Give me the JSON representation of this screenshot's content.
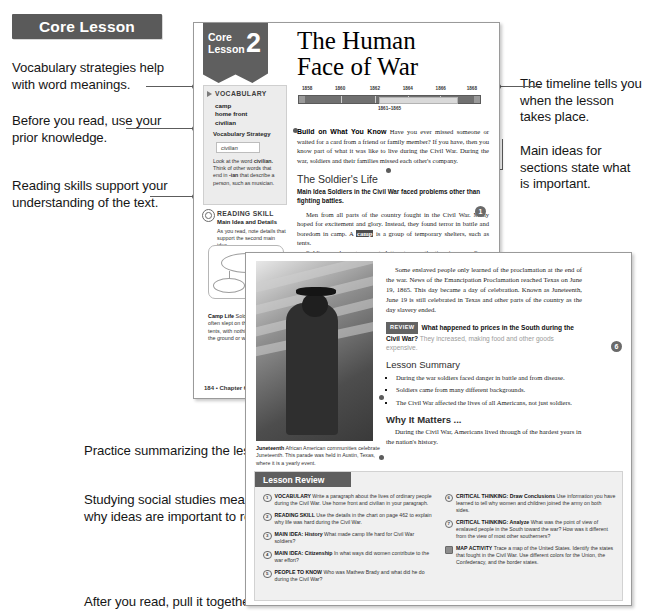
{
  "banner": {
    "label": "Core Lesson"
  },
  "annotations": {
    "left": [
      {
        "id": "vocab",
        "text": "Vocabulary strategies help with word meanings."
      },
      {
        "id": "prior",
        "text": "Before you read, use your prior knowledge."
      },
      {
        "id": "reading",
        "text": "Reading skills support your understanding of the text."
      },
      {
        "id": "practice",
        "text": "Practice summarizing the lesson."
      },
      {
        "id": "why",
        "text": "Studying social studies means asking why ideas are important to remember."
      },
      {
        "id": "pull",
        "text": "After you read, pull it together!"
      }
    ],
    "right": [
      {
        "id": "timeline",
        "text": "The timeline tells you when the lesson takes place."
      },
      {
        "id": "mainideas",
        "text": "Main ideas for sections state what is important."
      }
    ]
  },
  "page_one": {
    "flag": {
      "core": "Core",
      "lesson": "Lesson",
      "number": "2"
    },
    "title_line1": "The Human",
    "title_line2": "Face of War",
    "timeline": {
      "years": [
        "1858",
        "1860",
        "1862",
        "1864",
        "1866",
        "1868"
      ],
      "span_label": "1861–1865"
    },
    "vocabulary": {
      "heading": "VOCABULARY",
      "terms": [
        "camp",
        "home front",
        "civilian"
      ],
      "strategy_heading": "Vocabulary Strategy",
      "strategy_word": "civilian",
      "strategy_note_a": "Look at the word ",
      "strategy_note_b": "civilian.",
      "strategy_note_c": " Think of other words that end in ",
      "strategy_note_d": "-ian",
      "strategy_note_e": " that describe a person, such as musician."
    },
    "reading_skill": {
      "heading": "READING SKILL",
      "subheading": "Main Idea and Details",
      "body": "As you read, note details that support the second main idea."
    },
    "camp_life": {
      "title": "Camp Life",
      "body": " Soldiers in camp often slept on the ground in tents, with nothing to sit on but the ground or wooden boxes."
    },
    "build": {
      "label": "Build on What You Know",
      "body": " Have you ever missed someone or waited for a card from a friend or family member? If you have, then you know part of what it was like to live during the Civil War. During the war, soldiers and their families missed each other's company."
    },
    "section_heading": "The Soldier's Life",
    "main_idea": "Main Idea  Soldiers in the Civil War faced problems other than fighting battles.",
    "paragraph_1a": "Men from all parts of the country fought in the Civil War. Many hoped for excitement and glory. Instead, they found terror in battle and boredom in camp. A ",
    "paragraph_1_kw": "camp",
    "paragraph_1b": " is a group of temporary shelters, such as tents.",
    "paragraph_2": "Soldiers read, sang, or wrote letters to pass the time in camp. Some put on plays or held religious services. They loved to get letters from home. Letters brought joy to hearts from home.",
    "paragraph_3": "Food in the army was often bad. Union soldiers grew tired of eating hardtack, a hard, dry cracker. However, Confederate soldiers had less to eat because they did not have enough food.",
    "marker_number": "1",
    "folio": "184 • Chapter 6"
  },
  "page_two": {
    "paragraph_1": "Some enslaved people only learned of the proclamation at the end of the war. News of the Emancipation Proclamation reached Texas on June 19, 1865. This day became a day of celebration. Known as Juneteenth, June 19 is still celebrated in Texas and other parts of the country as the day slavery ended.",
    "review": {
      "tag": "REVIEW",
      "question": "What happened to prices in the South during the Civil War?",
      "answer": " They increased, making food and other goods expensive."
    },
    "summary_heading": "Lesson Summary",
    "summary_items": [
      "During the war soldiers faced danger in battle and from disease.",
      "Soldiers came from many different backgrounds.",
      "The Civil War affected the lives of all Americans, not just soldiers."
    ],
    "why_heading": "Why It Matters ...",
    "why_body": "During the Civil War, Americans lived through of the hardest years in the nation's history.",
    "folio": "6",
    "juneteenth": {
      "title": "Juneteenth",
      "body": " African American communities celebrate Juneteenth. This parade was held in Austin, Texas, where it is a yearly event."
    },
    "lesson_review": {
      "heading": "Lesson Review",
      "left_items": [
        {
          "badge": "1",
          "title": "VOCABULARY",
          "text": " Write a paragraph about the lives of ordinary people during the Civil War. Use home front and civilian in your paragraph."
        },
        {
          "badge": "2",
          "title": "READING SKILL",
          "text": " Use the details in the chart on page 462 to explain why life was hard during the Civil War."
        },
        {
          "badge": "3",
          "title": "MAIN IDEA: History",
          "text": " What made camp life hard for Civil War soldiers?"
        },
        {
          "badge": "4",
          "title": "MAIN IDEA: Citizenship",
          "text": " In what ways did women contribute to the war effort?"
        },
        {
          "badge": "5",
          "title": "PEOPLE TO KNOW",
          "text": " Who was Mathew Brady and what did he do during the Civil War?"
        }
      ],
      "right_items": [
        {
          "badge": "6",
          "title": "CRITICAL THINKING: Draw Conclusions",
          "text": " Use information you have learned to tell why women and children joined the army on both sides."
        },
        {
          "badge": "7",
          "title": "CRITICAL THINKING: Analyze",
          "text": " What was the point of view of enslaved people in the South toward the war? How was it different from the view of most other southerners?"
        },
        {
          "badge": "map",
          "title": "MAP ACTIVITY",
          "text": " Trace a map of the United States. Identify the states that fought in the Civil War. Use different colors for the Union, the Confederacy, and the border states."
        }
      ]
    }
  }
}
